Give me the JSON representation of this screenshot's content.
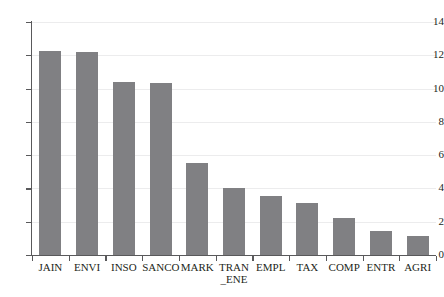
{
  "chart_data": {
    "type": "bar",
    "title": "",
    "subtitle": "",
    "xlabel": "",
    "ylabel": "",
    "categories": [
      "JAIN",
      "ENVI",
      "INSO",
      "SANCO",
      "MARK",
      "TRAN\n_ENE",
      "EMPL",
      "TAX",
      "COMP",
      "ENTR",
      "AGRI"
    ],
    "values": [
      12.25,
      12.22,
      10.4,
      10.35,
      5.55,
      4.05,
      3.55,
      3.15,
      2.2,
      1.45,
      1.15
    ],
    "ylim": [
      0,
      14
    ],
    "yticks": [
      0,
      2,
      4,
      6,
      8,
      10,
      12,
      14
    ],
    "ytick_labels": [
      "0",
      "2",
      "4",
      "6",
      "8",
      "10",
      "12",
      "14"
    ],
    "grid": true,
    "grid_axis": "y",
    "legend": "none",
    "bar_color": "#808083",
    "axis_color": "#59595b",
    "grid_color": "#ececed",
    "text_color": "#231f20",
    "annotations": []
  }
}
